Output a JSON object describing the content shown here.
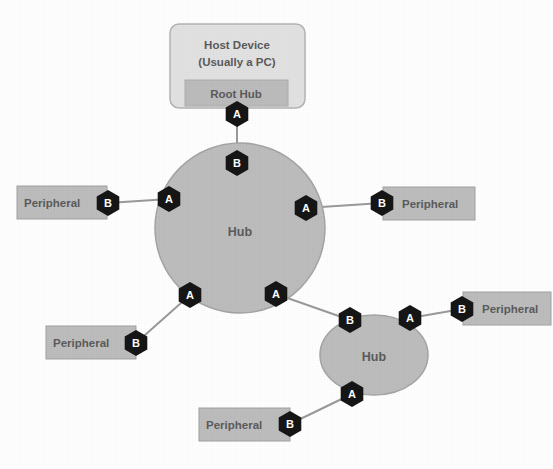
{
  "diagram": {
    "colors": {
      "background": "#ffffff",
      "box_fill": "#bdbdbd",
      "host_fill": "#e2e2e2",
      "hub_fill": "#bdbdbd",
      "connector_fill": "#161616",
      "connector_text": "#ffffff",
      "cable": "#9a9a9a",
      "label_text": "#5b5b5b"
    },
    "host": {
      "line1": "Host Device",
      "line2": "(Usually a PC)",
      "root_hub_label": "Root Hub",
      "root_hub_connector": "A"
    },
    "main_hub": {
      "label": "Hub",
      "upstream_connector": "B",
      "downstream_connectors": [
        "A",
        "A",
        "A",
        "A"
      ]
    },
    "second_hub": {
      "label": "Hub",
      "upstream_connector": "B",
      "downstream_connectors": [
        "A",
        "A"
      ]
    },
    "peripherals": [
      {
        "label": "Peripheral",
        "connector": "B",
        "position": "left"
      },
      {
        "label": "Peripheral",
        "connector": "B",
        "position": "right"
      },
      {
        "label": "Peripheral",
        "connector": "B",
        "position": "lower-left"
      },
      {
        "label": "Peripheral",
        "connector": "B",
        "position": "far-right"
      },
      {
        "label": "Peripheral",
        "connector": "B",
        "position": "bottom"
      }
    ],
    "connector_types": {
      "a": "A",
      "b": "B"
    }
  }
}
